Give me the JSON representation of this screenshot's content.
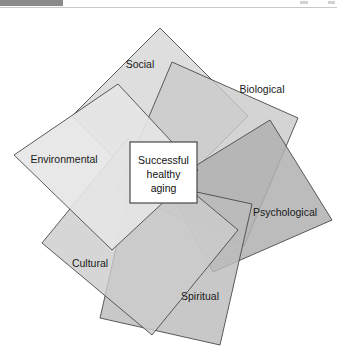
{
  "viewer": {
    "top_strip_present": true,
    "strip_color_dark": "#8a8a8a",
    "strip_color_light": "#fefefe"
  },
  "figure": {
    "center": {
      "line1": "Successful",
      "line2": "healthy",
      "line3": "aging",
      "fill": "#ffffff",
      "border": "#3a3a3a"
    },
    "background": "#ffffff",
    "stroke_color": "#4a4a4a",
    "domains": [
      {
        "id": "social",
        "label": "Social",
        "fill": "#d8d8d8",
        "opacity": 0.85,
        "points": "160,20 248,108 160,196 72,108",
        "label_x": 140,
        "label_y": 60,
        "label_anchor": "middle"
      },
      {
        "id": "biological",
        "label": "Biological",
        "fill": "#c9c9c9",
        "opacity": 0.8,
        "points": "172,54 298,110 244,238 118,182",
        "label_x": 262,
        "label_y": 85,
        "label_anchor": "middle"
      },
      {
        "id": "psychological",
        "label": "Psychological",
        "fill": "#b0b0b0",
        "opacity": 0.85,
        "points": "270,112 332,212 213,264 166,176",
        "label_x": 285,
        "label_y": 208,
        "label_anchor": "middle"
      },
      {
        "id": "spiritual",
        "label": "Spiritual",
        "fill": "#bcbcbc",
        "opacity": 0.82,
        "points": "132,170 252,196 220,337 100,310",
        "label_x": 200,
        "label_y": 292,
        "label_anchor": "middle"
      },
      {
        "id": "cultural",
        "label": "Cultural",
        "fill": "#cccccc",
        "opacity": 0.8,
        "points": "128,130 238,222 152,327 42,235",
        "label_x": 90,
        "label_y": 259,
        "label_anchor": "middle"
      },
      {
        "id": "environmental",
        "label": "Environmental",
        "fill": "#e6e6e6",
        "opacity": 0.9,
        "points": "118,76 198,162 112,242 14,147",
        "label_x": 64,
        "label_y": 155,
        "label_anchor": "middle"
      }
    ],
    "center_box": {
      "x": 130,
      "y": 134,
      "width": 67,
      "height": 61
    }
  }
}
